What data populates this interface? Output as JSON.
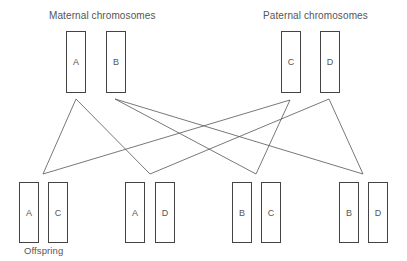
{
  "headings": {
    "maternal": "Maternal chromosomes",
    "paternal": "Paternal chromosomes",
    "offspring": "Offspring"
  },
  "parents": {
    "maternal": [
      {
        "label": "A",
        "x": 66,
        "y": 31,
        "w": 20,
        "h": 62
      },
      {
        "label": "B",
        "x": 106,
        "y": 31,
        "w": 20,
        "h": 62
      }
    ],
    "paternal": [
      {
        "label": "C",
        "x": 281,
        "y": 31,
        "w": 20,
        "h": 62
      },
      {
        "label": "D",
        "x": 320,
        "y": 31,
        "w": 20,
        "h": 62
      }
    ]
  },
  "offspring": [
    {
      "pair": [
        "A",
        "C"
      ],
      "boxes": [
        {
          "label": "A",
          "x": 19
        },
        {
          "label": "C",
          "x": 48
        }
      ]
    },
    {
      "pair": [
        "A",
        "D"
      ],
      "boxes": [
        {
          "label": "A",
          "x": 125
        },
        {
          "label": "D",
          "x": 155
        }
      ]
    },
    {
      "pair": [
        "B",
        "C"
      ],
      "boxes": [
        {
          "label": "B",
          "x": 232
        },
        {
          "label": "C",
          "x": 261
        }
      ]
    },
    {
      "pair": [
        "B",
        "D"
      ],
      "boxes": [
        {
          "label": "B",
          "x": 339
        },
        {
          "label": "D",
          "x": 368
        }
      ]
    }
  ],
  "connections": [
    {
      "from": "A",
      "to": "AC"
    },
    {
      "from": "A",
      "to": "AD"
    },
    {
      "from": "B",
      "to": "BC"
    },
    {
      "from": "B",
      "to": "BD"
    },
    {
      "from": "C",
      "to": "AC"
    },
    {
      "from": "C",
      "to": "BC"
    },
    {
      "from": "D",
      "to": "AD"
    },
    {
      "from": "D",
      "to": "BD"
    }
  ],
  "colors": {
    "line": "#555555",
    "box_border": "#444444",
    "text": "#555555"
  }
}
